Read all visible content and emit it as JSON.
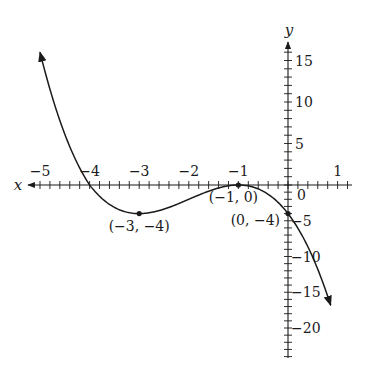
{
  "chart_data": {
    "type": "line",
    "title": "",
    "xlabel": "x",
    "ylabel": "y",
    "xlim": [
      -5.1,
      1.3
    ],
    "ylim": [
      -21,
      17
    ],
    "grid": false,
    "legend": null,
    "x_ticks": {
      "major": [
        -5,
        -4,
        -3,
        -2,
        -1,
        1
      ],
      "minor_step": 0.2
    },
    "y_ticks": {
      "major": [
        15,
        10,
        5,
        0,
        -5,
        -10,
        -15,
        -20
      ],
      "minor_step": 1
    },
    "x_tick_labels": [
      "−5",
      "−4",
      "−3",
      "−2",
      "−1",
      "1"
    ],
    "y_tick_labels": [
      "15",
      "10",
      "5",
      "0",
      "−5",
      "−10",
      "−15",
      "−20"
    ],
    "series": [
      {
        "name": "f(x) = -(x+1)^2 (x+4)",
        "x_range": [
          -5,
          0.86
        ],
        "arrows": [
          "start",
          "end"
        ],
        "color": "#1a1a1a"
      }
    ],
    "annotations": [
      {
        "point": [
          -3,
          -4
        ],
        "label": "(−3, −4)"
      },
      {
        "point": [
          -1,
          0
        ],
        "label": "(−1, 0)"
      },
      {
        "point": [
          0,
          -4
        ],
        "label": "(0, −4)"
      }
    ],
    "x_intercepts": [
      -4,
      -1
    ],
    "y_intercept": -4,
    "local_min": [
      -3,
      -4
    ],
    "local_max": [
      -1,
      0
    ]
  },
  "axes": {
    "x_label": "x",
    "y_label": "y",
    "origin_label": "0"
  }
}
